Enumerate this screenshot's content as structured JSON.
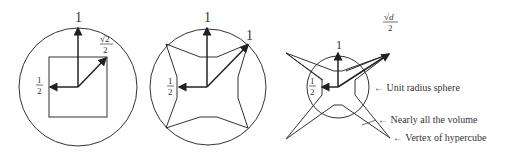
{
  "figures": [
    {
      "name": "square-in-circle",
      "labels": {
        "top": "1",
        "diag_num": "√2",
        "diag_den": "2",
        "half_num": "1",
        "half_den": "2"
      }
    },
    {
      "name": "star-in-circle",
      "labels": {
        "top": "1",
        "diag": "1",
        "half_num": "1",
        "half_den": "2"
      }
    },
    {
      "name": "hypercube-and-sphere",
      "labels": {
        "top": "1",
        "diag_num": "√d",
        "diag_den": "2",
        "half_num": "1",
        "half_den": "2"
      },
      "annotations": [
        "← Unit radius sphere",
        "← Nearly all the volume",
        "← Vertex of hypercube"
      ]
    }
  ]
}
